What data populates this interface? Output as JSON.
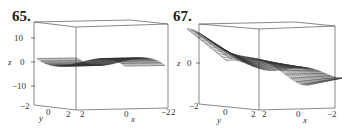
{
  "figures": [
    {
      "number": "65.",
      "z_ticks": [
        "10",
        "0",
        "−10"
      ],
      "z_label": "z",
      "y_ticks": [
        "−2",
        "0",
        "2"
      ],
      "y_label": "y",
      "x_ticks": [
        "2",
        "0",
        "−2"
      ],
      "x_label": "x"
    },
    {
      "number": "67.",
      "z_ticks": [
        "0"
      ],
      "z_label": "z",
      "y_ticks": [
        "−2",
        "0",
        "2"
      ],
      "y_label": "y",
      "x_ticks": [
        "2",
        "0",
        "−2"
      ],
      "x_label": "x",
      "left_edge_tick": "2"
    }
  ],
  "chart_data": [
    {
      "type": "surface3d",
      "title": "65.",
      "xlabel": "x",
      "ylabel": "y",
      "zlabel": "z",
      "x_range": [
        -2,
        2
      ],
      "y_range": [
        -2,
        2
      ],
      "z_range": [
        -15,
        15
      ],
      "z_ticks": [
        -10,
        0,
        10
      ],
      "x_ticks": [
        2,
        0,
        -2
      ],
      "y_ticks": [
        -2,
        0,
        2
      ],
      "style": "wireframe mesh",
      "description": "Twisted saddle-like surface; rises to about 15 near (x=2,y=-2) corner and falls to about -15 near opposite corner, roughly flat through the middle"
    },
    {
      "type": "surface3d",
      "title": "67.",
      "xlabel": "x",
      "ylabel": "y",
      "zlabel": "z",
      "x_range": [
        -2,
        2
      ],
      "y_range": [
        -2,
        2
      ],
      "z_ticks": [
        0
      ],
      "x_ticks": [
        2,
        0,
        -2
      ],
      "y_ticks": [
        -2,
        0,
        2
      ],
      "style": "wireframe mesh",
      "description": "Wave-shaped surface with a dip on the left, pinch at center, and a raised ridge on the right"
    }
  ]
}
